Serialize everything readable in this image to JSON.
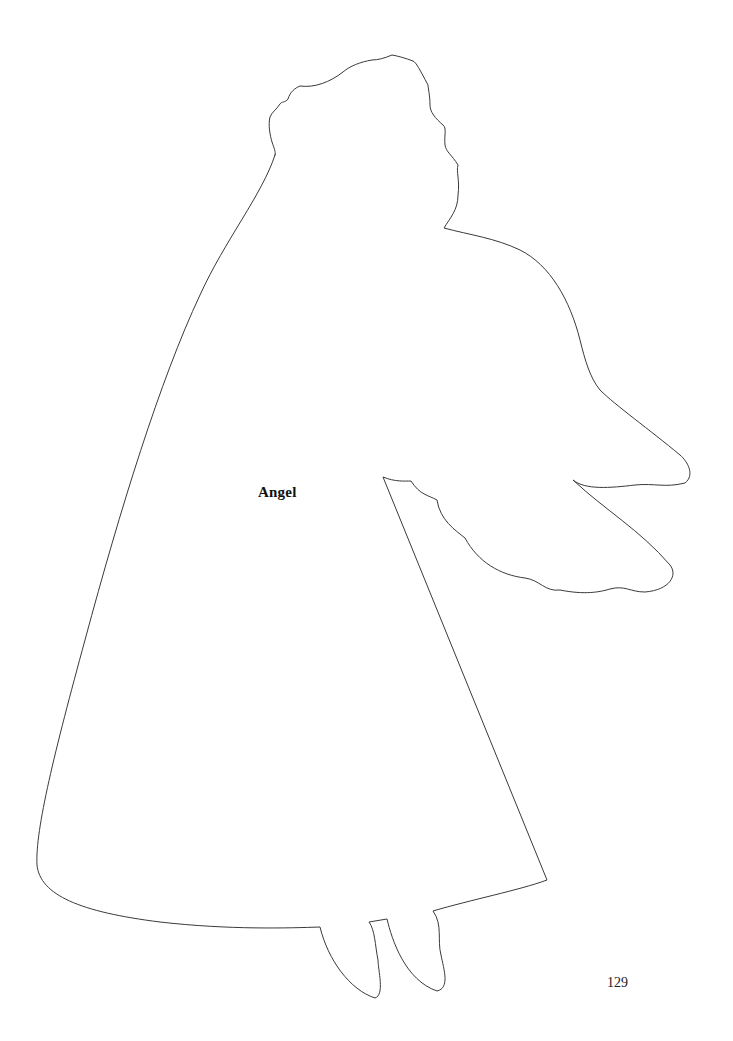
{
  "page": {
    "label": "Angel",
    "page_number": "129",
    "outline_color": "#3a3a3a",
    "background_color": "#ffffff"
  },
  "figure": {
    "subject": "angel",
    "style": "line-art-template-outline"
  }
}
